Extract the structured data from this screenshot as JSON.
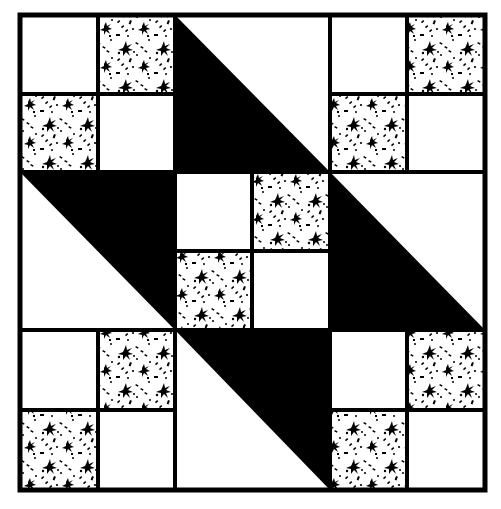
{
  "title": "Quilt block pattern",
  "colors": {
    "background": "#ffffff",
    "ink": "#000000",
    "fabric_light": "#ffffff"
  },
  "block": {
    "grid": "3x3",
    "cells": [
      {
        "row": 0,
        "col": 0,
        "type": "four-patch",
        "patches": [
          "plain",
          "print",
          "print",
          "plain"
        ]
      },
      {
        "row": 0,
        "col": 1,
        "type": "half-square-triangle",
        "dark": "lower-left"
      },
      {
        "row": 0,
        "col": 2,
        "type": "four-patch",
        "patches": [
          "plain",
          "print",
          "print",
          "plain"
        ]
      },
      {
        "row": 1,
        "col": 0,
        "type": "half-square-triangle",
        "dark": "upper-right"
      },
      {
        "row": 1,
        "col": 1,
        "type": "four-patch",
        "patches": [
          "plain",
          "print",
          "print",
          "plain"
        ]
      },
      {
        "row": 1,
        "col": 2,
        "type": "half-square-triangle",
        "dark": "lower-left"
      },
      {
        "row": 2,
        "col": 0,
        "type": "four-patch",
        "patches": [
          "plain",
          "print",
          "print",
          "plain"
        ]
      },
      {
        "row": 2,
        "col": 1,
        "type": "half-square-triangle",
        "dark": "upper-right"
      },
      {
        "row": 2,
        "col": 2,
        "type": "four-patch",
        "patches": [
          "plain",
          "print",
          "print",
          "plain"
        ]
      }
    ]
  },
  "icons": {
    "print_fabric": "floral-speckle-print",
    "plain_fabric": "plain-white"
  }
}
